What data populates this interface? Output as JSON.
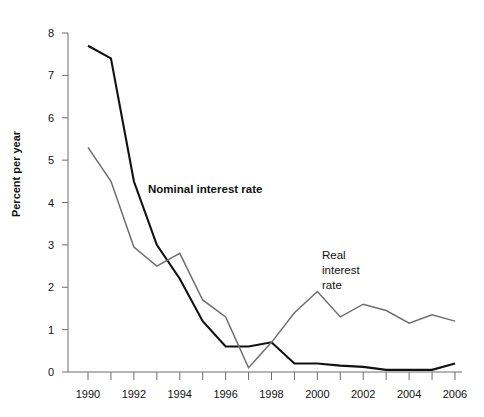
{
  "chart_data": {
    "type": "line",
    "title": "",
    "subtitle": "",
    "xlabel": "",
    "ylabel": "Percent per year",
    "xlim": [
      1990,
      2006
    ],
    "ylim": [
      0,
      8
    ],
    "yticks": [
      0,
      1,
      2,
      3,
      4,
      5,
      6,
      7,
      8
    ],
    "ytick_labels": [
      "0",
      "1",
      "2",
      "3",
      "4",
      "5",
      "6",
      "7",
      "8"
    ],
    "xticks": [
      1990,
      1991,
      1992,
      1993,
      1994,
      1995,
      1996,
      1997,
      1998,
      1999,
      2000,
      2001,
      2002,
      2003,
      2004,
      2005,
      2006
    ],
    "xtick_labels": [
      "1990",
      "",
      "1992",
      "",
      "1994",
      "",
      "1996",
      "",
      "1998",
      "",
      "2000",
      "",
      "2002",
      "",
      "2004",
      "",
      "2006"
    ],
    "xtick_labels_shown": [
      "1990",
      "1992",
      "1994",
      "1996",
      "1998",
      "2000",
      "2002",
      "2004",
      "2006"
    ],
    "grid": false,
    "legend_position": "inline-annotations",
    "x": [
      1990,
      1991,
      1992,
      1993,
      1994,
      1995,
      1996,
      1997,
      1998,
      1999,
      2000,
      2001,
      2002,
      2003,
      2004,
      2005,
      2006
    ],
    "series": [
      {
        "name": "Nominal interest rate",
        "color": "#111111",
        "width": 2.1,
        "values": [
          7.7,
          7.4,
          4.5,
          3.0,
          2.2,
          1.2,
          0.6,
          0.6,
          0.7,
          0.2,
          0.2,
          0.15,
          0.12,
          0.05,
          0.05,
          0.05,
          0.2
        ]
      },
      {
        "name": "Real interest rate",
        "color": "#6e6e6e",
        "width": 1.5,
        "values": [
          5.3,
          4.5,
          2.95,
          2.5,
          2.8,
          1.7,
          1.3,
          0.1,
          0.7,
          1.4,
          1.9,
          1.3,
          1.6,
          1.45,
          1.15,
          1.35,
          1.2
        ]
      }
    ],
    "annotations": [
      {
        "name": "nominal-series-label",
        "text": "Nominal interest rate",
        "bold": true,
        "x": 1994.0,
        "y": 4.45
      },
      {
        "name": "real-series-label",
        "text": "Real\ninterest\nrate",
        "bold": false,
        "x": 2000.0,
        "y": 2.9
      }
    ]
  },
  "axis": {
    "y_title": "Percent per year"
  },
  "labels": {
    "nominal": "Nominal interest rate",
    "real": "Real\ninterest\nrate"
  },
  "colors": {
    "nominal": "#111111",
    "real": "#6e6e6e",
    "axis": "#6d6d6d",
    "background": "#ffffff"
  }
}
